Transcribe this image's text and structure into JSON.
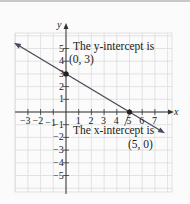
{
  "chart_data": {
    "type": "line",
    "title": "",
    "xlabel": "x",
    "ylabel": "y",
    "xlim": [
      -4,
      8
    ],
    "ylim": [
      -6,
      6
    ],
    "grid": true,
    "x_ticks": [
      "-3",
      "-2",
      "-1",
      "1",
      "2",
      "3",
      "4",
      "5",
      "6",
      "7"
    ],
    "y_ticks": [
      "5",
      "4",
      "3",
      "2",
      "1",
      "-1",
      "-2",
      "-3",
      "-4",
      "-5"
    ],
    "series": [
      {
        "name": "line",
        "equation": "y = -3/5 x + 3",
        "x": [
          -4,
          8
        ],
        "y": [
          5.4,
          -1.8
        ]
      }
    ],
    "points": [
      {
        "x": 0,
        "y": 3,
        "label": "(0, 3)"
      },
      {
        "x": 5,
        "y": 0,
        "label": "(5, 0)"
      }
    ],
    "annotations": [
      {
        "text": "The y-intercept is",
        "value": "(0, 3)"
      },
      {
        "text": "The x-intercept is",
        "value": "(5, 0)"
      }
    ]
  },
  "axes": {
    "x_label": "x",
    "y_label": "y",
    "x_ticks": [
      {
        "v": -3,
        "t": "−3"
      },
      {
        "v": -2,
        "t": "−2"
      },
      {
        "v": -1,
        "t": "−1"
      },
      {
        "v": 1,
        "t": "1"
      },
      {
        "v": 2,
        "t": "2"
      },
      {
        "v": 3,
        "t": "3"
      },
      {
        "v": 4,
        "t": "4"
      },
      {
        "v": 5,
        "t": "5"
      },
      {
        "v": 6,
        "t": "6"
      },
      {
        "v": 7,
        "t": "7"
      }
    ],
    "y_ticks": [
      {
        "v": 5,
        "t": "5"
      },
      {
        "v": 4,
        "t": "4"
      },
      {
        "v": 3,
        "t": "3"
      },
      {
        "v": 2,
        "t": "2"
      },
      {
        "v": 1,
        "t": "1"
      },
      {
        "v": -1,
        "t": "−1"
      },
      {
        "v": -2,
        "t": "−2"
      },
      {
        "v": -3,
        "t": "−3"
      },
      {
        "v": -4,
        "t": "−4"
      },
      {
        "v": -5,
        "t": "−5"
      }
    ]
  },
  "annotations": {
    "y_intercept_text": "The y-intercept is",
    "y_intercept_value": "(0, 3)",
    "x_intercept_text": "The x-intercept is",
    "x_intercept_value": "(5, 0)"
  },
  "colors": {
    "line": "#4a4a5a",
    "grid": "#dcdcdc",
    "axis": "#333333"
  }
}
